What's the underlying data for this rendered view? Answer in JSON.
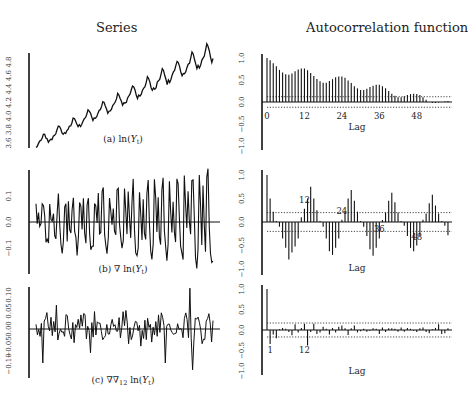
{
  "column_titles": {
    "left": "Series",
    "right": "Autocorrelation function"
  },
  "chart_data": [
    {
      "type": "line",
      "panel": "a-series",
      "caption": "(a) ln(Y_t)",
      "caption_parts": {
        "prefix": "(a) ln(",
        "var": "Y",
        "sub": "t",
        "suffix": ")"
      },
      "ylabel_ticks": [
        "3.6",
        "3.8",
        "4.0",
        "4.2",
        "4.4",
        "4.6",
        "4.8"
      ],
      "ylim": [
        3.6,
        4.8
      ],
      "description": "Upward trending log series with strong 12-period seasonality, ~144 monthly observations",
      "n": 144
    },
    {
      "type": "bar",
      "panel": "a-acf",
      "xlabel": "Lag",
      "x_ticks": [
        "0",
        "12",
        "24",
        "36",
        "48"
      ],
      "y_ticks": [
        "1.0",
        "0.5",
        "0.0",
        "−0.5",
        "−1.0"
      ],
      "ylim": [
        -1,
        1
      ],
      "conf_band": 0.12,
      "values": [
        1.0,
        0.95,
        0.88,
        0.81,
        0.73,
        0.67,
        0.63,
        0.62,
        0.65,
        0.7,
        0.74,
        0.76,
        0.76,
        0.72,
        0.66,
        0.59,
        0.52,
        0.47,
        0.44,
        0.44,
        0.48,
        0.52,
        0.56,
        0.58,
        0.58,
        0.55,
        0.49,
        0.43,
        0.36,
        0.31,
        0.27,
        0.27,
        0.3,
        0.34,
        0.37,
        0.39,
        0.39,
        0.36,
        0.31,
        0.25,
        0.19,
        0.14,
        0.11,
        0.11,
        0.13,
        0.16,
        0.18,
        0.19,
        0.18,
        0.16,
        0.11,
        0.05,
        0.0,
        -0.02,
        -0.02,
        -0.01,
        0.0,
        0.01,
        0.02,
        0.03,
        0.03,
        0.02
      ]
    },
    {
      "type": "line",
      "panel": "b-series",
      "caption": "(b) ∇ ln(Y_t)",
      "caption_parts": {
        "prefix": "(b) ∇ ln(",
        "var": "Y",
        "sub": "t",
        "suffix": ")"
      },
      "ylabel_ticks": [
        "−0.1",
        "0.0",
        "0.1"
      ],
      "ylim": [
        -0.2,
        0.22
      ],
      "description": "First-differenced log series oscillating around zero with seasonal pattern"
    },
    {
      "type": "bar",
      "panel": "b-acf",
      "xlabel": "Lag",
      "x_ticks": [
        "0",
        "12",
        "24",
        "36",
        "48"
      ],
      "annotations": [
        "12",
        "24",
        "36",
        "48"
      ],
      "y_ticks": [
        "1.0",
        "0.5",
        "0.0",
        "−0.5",
        "−1.0"
      ],
      "ylim": [
        -1,
        1
      ],
      "conf_band": 0.2,
      "values": [
        1.0,
        0.5,
        0.22,
        0.02,
        -0.1,
        -0.35,
        -0.55,
        -0.8,
        -0.65,
        -0.52,
        -0.35,
        0.1,
        0.28,
        0.5,
        0.75,
        0.5,
        0.25,
        0.02,
        -0.1,
        -0.35,
        -0.62,
        -0.7,
        -0.55,
        -0.35,
        0.05,
        0.22,
        0.5,
        0.68,
        0.45,
        0.22,
        0.02,
        -0.1,
        -0.3,
        -0.58,
        -0.72,
        -0.55,
        -0.35,
        0.04,
        0.2,
        0.45,
        0.62,
        0.42,
        0.2,
        0.02,
        -0.08,
        -0.3,
        -0.55,
        -0.62,
        -0.5,
        -0.3,
        0.05,
        0.18,
        0.4,
        0.58,
        0.35,
        0.18,
        0.02,
        -0.08,
        -0.28,
        -0.45,
        -0.52,
        -0.4,
        -0.22,
        0.02,
        0.14,
        0.3,
        0.5
      ]
    },
    {
      "type": "line",
      "panel": "c-series",
      "caption": "(c) ∇∇12 ln(Y_t)",
      "caption_parts": {
        "prefix": "(c) ∇∇",
        "sub12": "12",
        "mid": " ln(",
        "var": "Y",
        "sub": "t",
        "suffix": ")"
      },
      "ylabel_ticks": [
        "−0.10",
        "−0.05",
        "0.00",
        "0.05",
        "0.10"
      ],
      "ylim": [
        -0.12,
        0.12
      ],
      "description": "Seasonally and first differenced log series, roughly white noise around zero"
    },
    {
      "type": "bar",
      "panel": "c-acf",
      "xlabel": "Lag",
      "x_ticks": [
        "1",
        "12"
      ],
      "y_ticks": [
        "1.0",
        "0.5",
        "0.0",
        "−0.5",
        "−1.0"
      ],
      "ylim": [
        -1,
        1
      ],
      "conf_band": 0.17,
      "values": [
        1.0,
        -0.34,
        -0.11,
        -0.2,
        0.02,
        0.05,
        0.03,
        -0.05,
        -0.13,
        0.14,
        -0.06,
        0.05,
        0.15,
        -0.38,
        -0.05,
        0.15,
        -0.1,
        -0.06,
        0.08,
        0.03,
        -0.11,
        0.05,
        -0.06,
        0.08,
        0.11,
        0.04,
        -0.12,
        0.04,
        0.11,
        -0.06,
        -0.03,
        0.03,
        -0.04,
        -0.02,
        0.04,
        0.03,
        -0.1,
        0.06,
        -0.05,
        0.04,
        0.04,
        0.03,
        -0.04,
        0.06,
        -0.04,
        0.05,
        0.03,
        -0.02,
        -0.05,
        0.04,
        0.06,
        -0.05,
        -0.08,
        0.02,
        0.05,
        0.14,
        -0.1,
        -0.08,
        0.04,
        0.03,
        0.02,
        0.05,
        0.03
      ]
    }
  ],
  "axis_labels": {
    "lag": "Lag"
  }
}
